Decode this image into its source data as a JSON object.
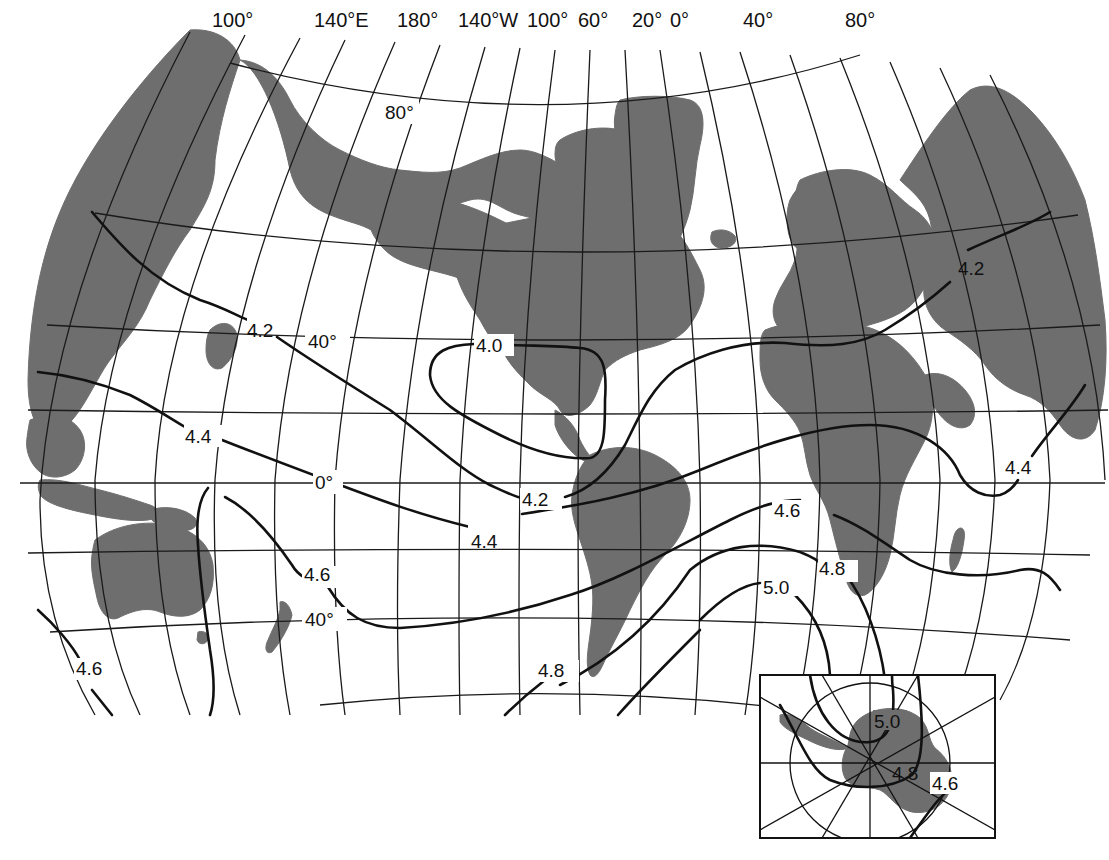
{
  "map": {
    "type": "isoline world map",
    "longitude_labels": [
      "100°",
      "140°E",
      "180°",
      "140°W",
      "100°",
      "60°",
      "20°",
      "0°",
      "40°",
      "80°"
    ],
    "latitude_labels": [
      "80°",
      "40°",
      "0°",
      "40°"
    ],
    "contours": [
      {
        "value": "4.0",
        "label": "4.0"
      },
      {
        "value": "4.2",
        "label": "4.2"
      },
      {
        "value": "4.2",
        "label": "4.2"
      },
      {
        "value": "4.2",
        "label": "4.2"
      },
      {
        "value": "4.4",
        "label": "4.4"
      },
      {
        "value": "4.4",
        "label": "4.4"
      },
      {
        "value": "4.4",
        "label": "4.4"
      },
      {
        "value": "4.6",
        "label": "4.6"
      },
      {
        "value": "4.6",
        "label": "4.6"
      },
      {
        "value": "4.6",
        "label": "4.6"
      },
      {
        "value": "4.8",
        "label": "4.8"
      },
      {
        "value": "4.8",
        "label": "4.8"
      },
      {
        "value": "5.0",
        "label": "5.0"
      }
    ],
    "inset": {
      "name": "antarctic-polar-inset",
      "labels": [
        "5.0",
        "4.8",
        "4.6"
      ]
    },
    "colors": {
      "land": "#6e6e6e",
      "ocean": "#ffffff",
      "lines": "#111111"
    }
  }
}
